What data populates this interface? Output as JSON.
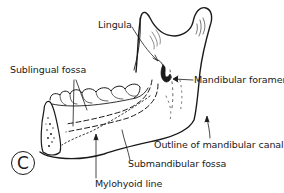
{
  "figure": {
    "panel_letter": "C",
    "labels": {
      "lingula": "Lingula",
      "sublingual_fossa": "Sublingual fossa",
      "mandibular_foramen": "Mandibular foramen",
      "outline_mandibular_canal": "Outline of mandibular canal",
      "submandibular_fossa": "Submandibular fossa",
      "mylohyoid_line": "Mylohyoid line"
    },
    "colors": {
      "ink": "#1a1a1a",
      "background": "#ffffff"
    }
  }
}
